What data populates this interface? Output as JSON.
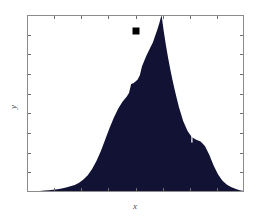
{
  "figure": {
    "background_color": "#ffffff",
    "plot_area": {
      "left": 27,
      "top": 15,
      "right": 244,
      "bottom": 192,
      "frame_color": "#8c8c8c",
      "frame_width": 1,
      "facecolor": "#ffffff"
    },
    "axes": {
      "x_label": "x",
      "y_label": "y",
      "x_label_position": "bottom-center",
      "y_label_position": "left-center-rotated",
      "tick_direction": "in",
      "tick_color": "#6e6e6e",
      "tick_length": 4,
      "x_ticks_count": 7,
      "y_ticks_count": 8,
      "tick_labels_shown": false
    },
    "marker": {
      "name": "peak-marker",
      "shape": "square",
      "color": "#000000",
      "x": 136,
      "y": 31,
      "size": 7
    }
  },
  "chart_data": {
    "type": "area",
    "title": "",
    "subtitle": "",
    "xlabel": "x",
    "ylabel": "y",
    "legend": [],
    "legend_position": "none",
    "grid": false,
    "series_color": "#121235",
    "xlim": [
      0,
      100
    ],
    "ylim": [
      0,
      100
    ],
    "x": [
      0,
      2,
      4,
      6,
      8,
      10,
      12,
      14,
      16,
      18,
      20,
      22,
      24,
      26,
      28,
      30,
      32,
      34,
      36,
      38,
      40,
      42,
      44,
      46,
      47,
      48,
      49,
      50,
      51,
      52,
      53,
      54,
      55,
      56,
      57,
      58,
      59,
      60,
      61,
      62,
      63,
      64,
      65,
      66,
      67,
      68,
      69,
      70,
      72,
      74,
      76,
      78,
      80,
      82,
      84,
      86,
      88,
      90,
      92,
      94,
      96,
      98,
      100
    ],
    "values": [
      0.3,
      0.4,
      0.5,
      0.6,
      0.8,
      1.0,
      1.3,
      1.6,
      2.0,
      2.5,
      3.2,
      4.0,
      5.2,
      7.0,
      9.5,
      13.0,
      17.5,
      23.0,
      29.5,
      36.0,
      42.0,
      47.0,
      51.0,
      54.0,
      56.0,
      61.0,
      61.5,
      62.5,
      63.5,
      66.0,
      71.0,
      74.0,
      77.0,
      79.5,
      82.0,
      84.5,
      88.0,
      91.5,
      95.5,
      100.0,
      91.0,
      83.0,
      76.0,
      69.5,
      63.5,
      58.0,
      53.0,
      48.0,
      40.0,
      34.5,
      31.0,
      29.5,
      28.5,
      26.0,
      21.0,
      15.0,
      10.0,
      6.5,
      4.2,
      2.8,
      1.8,
      1.0,
      0.5
    ],
    "peak": {
      "x": 62,
      "y": 100
    }
  }
}
